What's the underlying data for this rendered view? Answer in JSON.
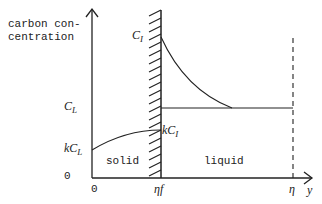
{
  "diagram": {
    "y_axis_label_line1": "carbon con-",
    "y_axis_label_line2": "centration",
    "x_axis_label": "y",
    "y_ticks": {
      "CL": {
        "main": "C",
        "sub": "L"
      },
      "kCL": {
        "main": "kC",
        "sub": "L"
      },
      "zero": "0"
    },
    "x_ticks": {
      "zero": "0",
      "interface": {
        "main": "η",
        "sub": "f"
      },
      "eta": "η"
    },
    "interface_top_label": {
      "main": "C",
      "sub": "I"
    },
    "interface_bottom_label": {
      "main": "kC",
      "sub": "I"
    },
    "region_solid": "solid",
    "region_liquid": "liquid",
    "colors": {
      "line": "#222222",
      "background": "#ffffff"
    }
  }
}
